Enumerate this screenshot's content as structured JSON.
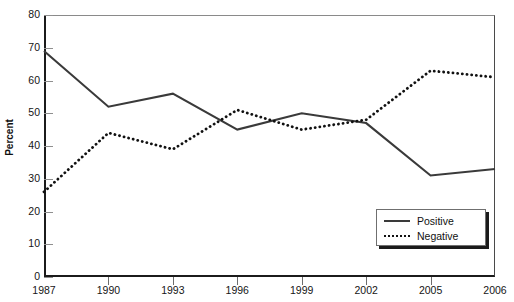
{
  "chart_data": {
    "type": "line",
    "title": "",
    "xlabel": "",
    "ylabel": "Percent",
    "categories": [
      "1987",
      "1990",
      "1993",
      "1996",
      "1999",
      "2002",
      "2005",
      "2006"
    ],
    "ylim": [
      0,
      80
    ],
    "yticks": [
      0,
      10,
      20,
      30,
      40,
      50,
      60,
      70,
      80
    ],
    "grid": false,
    "legend_position": "lower-right",
    "series": [
      {
        "name": "Positive",
        "style": "solid",
        "color": "#3a3a3a",
        "values": [
          69,
          52,
          56,
          45,
          50,
          47,
          31,
          33
        ]
      },
      {
        "name": "Negative",
        "style": "dotted",
        "color": "#111111",
        "values": [
          26,
          44,
          39,
          51,
          45,
          48,
          63,
          61
        ]
      }
    ]
  },
  "axes": {
    "y_title": "Percent",
    "y_tick_labels": [
      "0",
      "10",
      "20",
      "30",
      "40",
      "50",
      "60",
      "70",
      "80"
    ],
    "x_tick_labels": [
      "1987",
      "1990",
      "1993",
      "1996",
      "1999",
      "2002",
      "2005",
      "2006"
    ]
  },
  "legend": {
    "entries": [
      {
        "label": "Positive",
        "style": "solid"
      },
      {
        "label": "Negative",
        "style": "dotted"
      }
    ]
  }
}
